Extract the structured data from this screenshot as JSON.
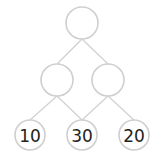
{
  "diagram": {
    "type": "binary-tree",
    "colors": {
      "edge": "#d0d0d0",
      "node_stroke": "#cfcfcf",
      "node_fill": "#ffffff",
      "text": "#222222"
    },
    "nodes": [
      {
        "id": "root",
        "label": "",
        "x": 82,
        "y": 23,
        "r": 16
      },
      {
        "id": "mid-left",
        "label": "",
        "x": 57,
        "y": 80,
        "r": 16
      },
      {
        "id": "mid-right",
        "label": "",
        "x": 108,
        "y": 80,
        "r": 16
      },
      {
        "id": "leaf-left",
        "label": "10",
        "x": 30,
        "y": 135,
        "r": 15
      },
      {
        "id": "leaf-center",
        "label": "30",
        "x": 82,
        "y": 135,
        "r": 15
      },
      {
        "id": "leaf-right",
        "label": "20",
        "x": 134,
        "y": 135,
        "r": 15
      }
    ],
    "edges": [
      {
        "from": "root",
        "to": "mid-left"
      },
      {
        "from": "root",
        "to": "mid-right"
      },
      {
        "from": "mid-left",
        "to": "leaf-left"
      },
      {
        "from": "mid-left",
        "to": "leaf-center"
      },
      {
        "from": "mid-right",
        "to": "leaf-center"
      },
      {
        "from": "mid-right",
        "to": "leaf-right"
      }
    ]
  }
}
